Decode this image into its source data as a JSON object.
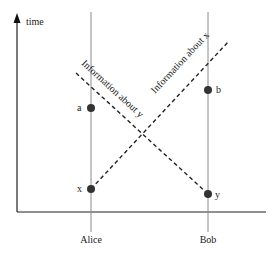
{
  "diagram": {
    "type": "spacetime-diagram",
    "axis": {
      "time_label": "time"
    },
    "worldlines": [
      {
        "name": "Alice",
        "x": 91
      },
      {
        "name": "Bob",
        "x": 208
      }
    ],
    "events": [
      {
        "label": "a",
        "worldline": "Alice"
      },
      {
        "label": "x",
        "worldline": "Alice"
      },
      {
        "label": "b",
        "worldline": "Bob"
      },
      {
        "label": "y",
        "worldline": "Bob"
      }
    ],
    "signals": [
      {
        "label": "Information about y",
        "style": "dashed"
      },
      {
        "label": "Information about x",
        "style": "dashed"
      }
    ],
    "colors": {
      "worldline": "#8a8a8a",
      "axis": "#222222",
      "event": "#333333",
      "signal": "#222222"
    }
  }
}
